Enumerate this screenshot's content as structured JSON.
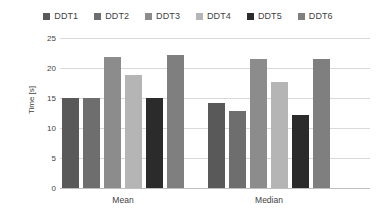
{
  "chart_data": {
    "type": "bar",
    "title": "",
    "xlabel": "",
    "ylabel": "Time [s]",
    "categories": [
      "Mean",
      "Median"
    ],
    "ylim": [
      0,
      25
    ],
    "yticks": [
      0,
      5,
      10,
      15,
      20,
      25
    ],
    "ytick_labels": [
      "0",
      "5",
      "10",
      "15",
      "20",
      "25"
    ],
    "grid": true,
    "legend_position": "top",
    "series": [
      {
        "name": "DDT1",
        "color": "#595959",
        "values": [
          15.2,
          14.4
        ]
      },
      {
        "name": "DDT2",
        "color": "#6e6e6e",
        "values": [
          15.2,
          13.0
        ]
      },
      {
        "name": "DDT3",
        "color": "#8c8c8c",
        "values": [
          22.0,
          21.6
        ]
      },
      {
        "name": "DDT4",
        "color": "#b5b5b5",
        "values": [
          19.0,
          17.8
        ]
      },
      {
        "name": "DDT5",
        "color": "#2b2b2b",
        "values": [
          15.1,
          12.4
        ]
      },
      {
        "name": "DDT6",
        "color": "#7f7f7f",
        "values": [
          22.4,
          21.7
        ]
      }
    ]
  },
  "axis": {
    "y_title": "Time [s]"
  },
  "colors": {
    "gridline": "#d9d9d9",
    "axis": "#bfbfbf",
    "text": "#3f3f3f",
    "background": "#ffffff"
  }
}
